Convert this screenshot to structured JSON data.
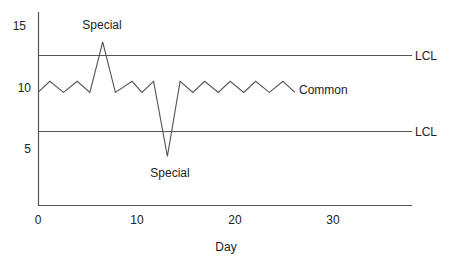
{
  "chart_data": {
    "type": "line",
    "title": "",
    "xlabel": "Day",
    "ylabel": "",
    "xlim": [
      0,
      38
    ],
    "ylim": [
      0.5,
      16
    ],
    "x_ticks": [
      0,
      10,
      20,
      30
    ],
    "y_ticks": [
      5,
      10,
      15
    ],
    "x_tick_labels": [
      "0",
      "10",
      "20",
      "30"
    ],
    "y_tick_labels": [
      "5",
      "10",
      "15"
    ],
    "grid": false,
    "legend": null,
    "series": [
      {
        "name": "Process",
        "x": [
          0,
          1.2,
          2.6,
          4.0,
          5.3,
          6.6,
          7.9,
          9.6,
          10.6,
          11.8,
          13.2,
          14.5,
          15.8,
          17.0,
          18.4,
          19.6,
          21.0,
          22.2,
          23.6,
          25.0,
          26.2
        ],
        "y": [
          9.6,
          10.5,
          9.6,
          10.5,
          9.6,
          13.7,
          9.6,
          10.5,
          9.6,
          10.5,
          4.4,
          10.5,
          9.6,
          10.5,
          9.6,
          10.5,
          9.6,
          10.5,
          9.6,
          10.5,
          9.6
        ]
      }
    ],
    "reference_lines": [
      {
        "name": "upper",
        "label": "LCL",
        "y": 12.6
      },
      {
        "name": "lower",
        "label": "LCL",
        "y": 6.4
      }
    ],
    "annotations": [
      {
        "text": "Special",
        "x": 6.6,
        "y": 13.7,
        "position": "above"
      },
      {
        "text": "Special",
        "x": 13.2,
        "y": 4.4,
        "position": "below"
      },
      {
        "text": "Common",
        "x": 26.2,
        "y": 10.0,
        "position": "right"
      }
    ]
  },
  "labels": {
    "x_axis_title": "Day",
    "y_ticks": [
      "15",
      "10",
      "5"
    ],
    "x_ticks": [
      "0",
      "10",
      "20",
      "30"
    ],
    "upper_line_label": "LCL",
    "lower_line_label": "LCL",
    "special_top": "Special",
    "special_bottom": "Special",
    "common": "Common"
  },
  "colors": {
    "line": "#555555",
    "text": "#222222",
    "background": "#ffffff"
  }
}
